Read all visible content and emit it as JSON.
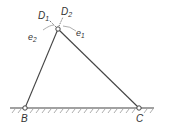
{
  "diagram": {
    "type": "mechanism-linkage",
    "labels": {
      "D1": "D",
      "D1_sub": "1",
      "D2": "D",
      "D2_sub": "2",
      "e1": "e",
      "e1_sub": "1",
      "e2": "e",
      "e2_sub": "2",
      "B": "B",
      "C": "C"
    },
    "points": {
      "apex": [
        58,
        29
      ],
      "B": [
        25,
        108
      ],
      "C": [
        139,
        108
      ]
    },
    "ground": {
      "y": 108,
      "x_start": 10,
      "x_end": 154
    },
    "colors": {
      "line": "#444444",
      "hatch": "#888888",
      "dashed": "#777777"
    }
  }
}
